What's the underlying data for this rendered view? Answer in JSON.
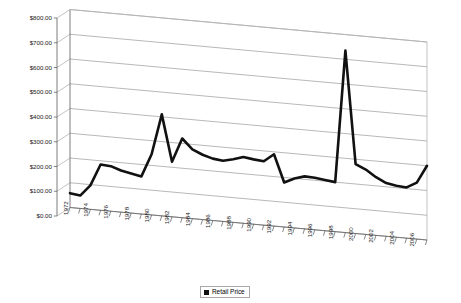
{
  "chart_data": {
    "type": "line",
    "title": "",
    "xlabel": "",
    "ylabel": "",
    "ylim": [
      0,
      800
    ],
    "ytick_step": 100,
    "ytick_labels": [
      "$0.00",
      "$100.00",
      "$200.00",
      "$300.00",
      "$400.00",
      "$500.00",
      "$600.00",
      "$700.00",
      "$800.00"
    ],
    "ytick_values": [
      0,
      100,
      200,
      300,
      400,
      500,
      600,
      700,
      800
    ],
    "grid": true,
    "legend_position": "bottom",
    "style": "3d-perspective-line",
    "categories": [
      "1972",
      "1973",
      "1974",
      "1975",
      "1976",
      "1977",
      "1978",
      "1979",
      "1980",
      "1981",
      "1982",
      "1983",
      "1984",
      "1985",
      "1986",
      "1987",
      "1988",
      "1989",
      "1990",
      "1991",
      "1992",
      "1993",
      "1994",
      "1995",
      "1996",
      "1997",
      "1998",
      "1999",
      "2000",
      "2001",
      "2002",
      "2003",
      "2004",
      "2005",
      "2006",
      "2007"
    ],
    "xtick_labels": [
      "1972",
      "1974",
      "1976",
      "1978",
      "1980",
      "1982",
      "1984",
      "1986",
      "1988",
      "1990",
      "1992",
      "1994",
      "1996",
      "1998",
      "2000",
      "2002",
      "2004",
      "2006"
    ],
    "series": [
      {
        "name": "Retail Price",
        "color": "#111111",
        "values": [
          58,
          52,
          97,
          185,
          182,
          168,
          160,
          152,
          245,
          410,
          222,
          320,
          280,
          262,
          250,
          245,
          255,
          268,
          262,
          258,
          290,
          180,
          200,
          212,
          210,
          205,
          200,
          735,
          280,
          262,
          235,
          215,
          208,
          205,
          228,
          300
        ]
      }
    ]
  },
  "legend": {
    "items": [
      {
        "label": "Retail Price",
        "color": "#111111"
      }
    ]
  }
}
